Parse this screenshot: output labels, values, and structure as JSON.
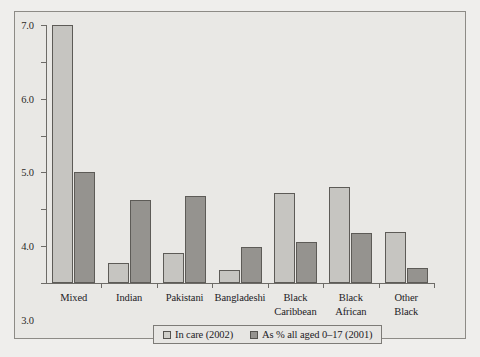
{
  "chart_data": {
    "type": "bar",
    "title": "",
    "subtitle": "",
    "xlabel": "",
    "ylabel": "",
    "ylim": [
      0.0,
      7.0
    ],
    "ytick_labels": [
      "0.0",
      "1.0",
      "2.0",
      "3.0",
      "4.0",
      "5.0",
      "6.0",
      "7.0"
    ],
    "ytick_values": [
      0.0,
      1.0,
      2.0,
      3.0,
      4.0,
      5.0,
      6.0,
      7.0
    ],
    "grid": false,
    "legend_position": "bottom-center",
    "categories": [
      "Mixed",
      "Indian",
      "Pakistani",
      "Bangladeshi",
      "Black Caribbean",
      "Black African",
      "Other Black"
    ],
    "category_lines": [
      [
        "Mixed"
      ],
      [
        "Indian"
      ],
      [
        "Pakistani"
      ],
      [
        "Bangladeshi"
      ],
      [
        "Black",
        "Caribbean"
      ],
      [
        "Black",
        "African"
      ],
      [
        "Other",
        "Black"
      ]
    ],
    "series": [
      {
        "name": "In care (2002)",
        "color": "#c6c5c1",
        "values": [
          7.0,
          0.55,
          0.82,
          0.35,
          2.45,
          2.6,
          1.38
        ]
      },
      {
        "name": "As % all aged 0–17 (2001)",
        "color": "#95938f",
        "values": [
          3.0,
          2.25,
          2.35,
          0.98,
          1.1,
          1.35,
          0.4
        ]
      }
    ]
  },
  "legend": {
    "items": [
      {
        "label": "In care (2002)"
      },
      {
        "label": "As % all aged 0–17 (2001)"
      }
    ]
  },
  "colors": {
    "figure_background": "#e9e8e5",
    "figure_border": "#8d8b86",
    "axis": "#6d6b67",
    "series_1": "#c6c5c1",
    "series_2": "#95938f",
    "bar_outline": "#5d5b57",
    "text": "#23211f"
  },
  "icons": {
    "legend_swatch_1": "square-outline-icon",
    "legend_swatch_2": "square-filled-icon"
  }
}
